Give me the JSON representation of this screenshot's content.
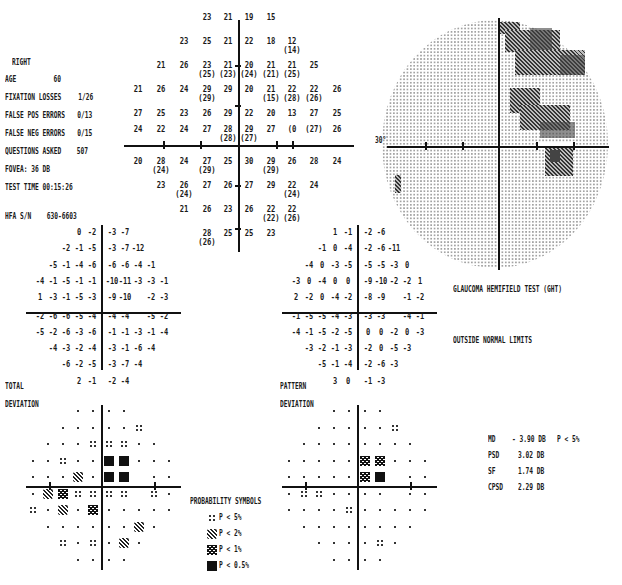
{
  "header": {
    "eye": "RIGHT",
    "age_label": "AGE",
    "age_value": "60",
    "fixation_losses_label": "FIXATION LOSSES",
    "fixation_losses_value": "1/26",
    "false_pos_label": "FALSE POS ERRORS",
    "false_pos_value": "0/13",
    "false_neg_label": "FALSE NEG ERRORS",
    "false_neg_value": "0/15",
    "questions_label": "QUESTIONS ASKED",
    "questions_value": "507",
    "fovea_label": "FOVEA:",
    "fovea_value": "36 DB",
    "test_time_label": "TEST TIME",
    "test_time_value": "00:15:26",
    "hfa_sn_label": "HFA S/N",
    "hfa_sn_value": "630-6603"
  },
  "threshold_grid": {
    "rows": [
      {
        "y": 13,
        "cells": [
          {
            "x": 207,
            "v": "23"
          },
          {
            "x": 228,
            "v": "21"
          },
          {
            "x": 249,
            "v": "19"
          },
          {
            "x": 271,
            "v": "15"
          }
        ]
      },
      {
        "y": 37,
        "cells": [
          {
            "x": 184,
            "v": "23"
          },
          {
            "x": 207,
            "v": "25"
          },
          {
            "x": 228,
            "v": "21"
          },
          {
            "x": 249,
            "v": "22"
          },
          {
            "x": 271,
            "v": "18"
          },
          {
            "x": 292,
            "v": "12",
            "p": "(14)"
          }
        ]
      },
      {
        "y": 61,
        "cells": [
          {
            "x": 161,
            "v": "21"
          },
          {
            "x": 184,
            "v": "26"
          },
          {
            "x": 207,
            "v": "23",
            "p": "(25)"
          },
          {
            "x": 228,
            "v": "21",
            "p": "(23)"
          },
          {
            "x": 249,
            "v": "20",
            "p": "(24)"
          },
          {
            "x": 271,
            "v": "21",
            "p": "(21)"
          },
          {
            "x": 292,
            "v": "21",
            "p": "(25)"
          },
          {
            "x": 314,
            "v": "25"
          }
        ]
      },
      {
        "y": 85,
        "cells": [
          {
            "x": 138,
            "v": "21"
          },
          {
            "x": 161,
            "v": "26"
          },
          {
            "x": 184,
            "v": "24"
          },
          {
            "x": 207,
            "v": "29",
            "p": "(29)"
          },
          {
            "x": 228,
            "v": "29"
          },
          {
            "x": 249,
            "v": "20"
          },
          {
            "x": 271,
            "v": "21",
            "p": "(15)"
          },
          {
            "x": 292,
            "v": "22",
            "p": "(28)"
          },
          {
            "x": 314,
            "v": "22",
            "p": "(26)"
          },
          {
            "x": 337,
            "v": "26"
          }
        ]
      },
      {
        "y": 109,
        "cells": [
          {
            "x": 138,
            "v": "27"
          },
          {
            "x": 161,
            "v": "25"
          },
          {
            "x": 184,
            "v": "23"
          },
          {
            "x": 207,
            "v": "26"
          },
          {
            "x": 228,
            "v": "29"
          },
          {
            "x": 249,
            "v": "22"
          },
          {
            "x": 271,
            "v": "20"
          },
          {
            "x": 292,
            "v": "13"
          },
          {
            "x": 314,
            "v": "27"
          },
          {
            "x": 337,
            "v": "25"
          }
        ]
      },
      {
        "y": 125,
        "cells": [
          {
            "x": 138,
            "v": "24"
          },
          {
            "x": 161,
            "v": "22"
          },
          {
            "x": 184,
            "v": "24"
          },
          {
            "x": 207,
            "v": "27"
          },
          {
            "x": 228,
            "v": "28",
            "p": "(28)"
          },
          {
            "x": 249,
            "v": "29",
            "p": "(27)"
          },
          {
            "x": 271,
            "v": "27"
          },
          {
            "x": 292,
            "v": "(0"
          },
          {
            "x": 314,
            "v": "(27)"
          },
          {
            "x": 337,
            "v": "26"
          }
        ]
      },
      {
        "y": 157,
        "cells": [
          {
            "x": 138,
            "v": "20"
          },
          {
            "x": 161,
            "v": "28",
            "p": "(24)"
          },
          {
            "x": 184,
            "v": "24"
          },
          {
            "x": 207,
            "v": "27",
            "p": "(29)"
          },
          {
            "x": 228,
            "v": "25"
          },
          {
            "x": 249,
            "v": "30"
          },
          {
            "x": 271,
            "v": "29",
            "p": "(29)"
          },
          {
            "x": 292,
            "v": "26"
          },
          {
            "x": 314,
            "v": "28"
          },
          {
            "x": 337,
            "v": "24"
          }
        ]
      },
      {
        "y": 181,
        "cells": [
          {
            "x": 161,
            "v": "23"
          },
          {
            "x": 184,
            "v": "26",
            "p": "(24)"
          },
          {
            "x": 207,
            "v": "27"
          },
          {
            "x": 228,
            "v": "26"
          },
          {
            "x": 249,
            "v": "27"
          },
          {
            "x": 271,
            "v": "29"
          },
          {
            "x": 292,
            "v": "22",
            "p": "(24)"
          },
          {
            "x": 314,
            "v": "24"
          }
        ]
      },
      {
        "y": 205,
        "cells": [
          {
            "x": 184,
            "v": "21"
          },
          {
            "x": 207,
            "v": "26"
          },
          {
            "x": 228,
            "v": "23"
          },
          {
            "x": 249,
            "v": "26"
          },
          {
            "x": 271,
            "v": "22",
            "p": "(22)"
          },
          {
            "x": 292,
            "v": "22",
            "p": "(26)"
          }
        ]
      },
      {
        "y": 229,
        "cells": [
          {
            "x": 207,
            "v": "28",
            "p": "(26)"
          },
          {
            "x": 228,
            "v": "25"
          },
          {
            "x": 249,
            "v": "25"
          },
          {
            "x": 271,
            "v": "23"
          }
        ]
      }
    ]
  },
  "grayscale": {
    "degree_label": "30°"
  },
  "total_deviation": {
    "label_line1": "TOTAL",
    "label_line2": "DEVIATION",
    "rows": [
      [
        "",
        "",
        "",
        "0",
        "-2",
        "-3",
        "-7",
        "",
        "",
        ""
      ],
      [
        "",
        "",
        "-2",
        "-1",
        "-5",
        "-3",
        "-7",
        "-12",
        "",
        ""
      ],
      [
        "",
        "-5",
        "-1",
        "-4",
        "-6",
        "-6",
        "-6",
        "-4",
        "-1",
        ""
      ],
      [
        "-4",
        "-1",
        "-5",
        "-1",
        "-1",
        "-10",
        "-11",
        "-3",
        "-3",
        "-1"
      ],
      [
        "1",
        "-3",
        "-1",
        "-5",
        "-3",
        "-9",
        "-10",
        "",
        "-2",
        "-3"
      ],
      [
        "-2",
        "-6",
        "-6",
        "-5",
        "-4",
        "-4",
        "-4",
        "",
        "-5",
        "-2"
      ],
      [
        "-5",
        "-2",
        "-6",
        "-3",
        "-6",
        "-1",
        "-1",
        "-3",
        "-1",
        "-4"
      ],
      [
        "",
        "-4",
        "-3",
        "-2",
        "-4",
        "-3",
        "-1",
        "-6",
        "-4",
        ""
      ],
      [
        "",
        "",
        "-6",
        "-2",
        "-5",
        "-3",
        "-7",
        "-4",
        "",
        ""
      ],
      [
        "",
        "",
        "",
        "2",
        "-1",
        "-2",
        "-4",
        "",
        "",
        ""
      ]
    ]
  },
  "pattern_deviation": {
    "label_line1": "PATTERN",
    "label_line2": "DEVIATION",
    "rows": [
      [
        "",
        "",
        "",
        "1",
        "-1",
        "-2",
        "-6",
        "",
        "",
        ""
      ],
      [
        "",
        "",
        "-1",
        "0",
        "-4",
        "-2",
        "-6",
        "-11",
        "",
        ""
      ],
      [
        "",
        "-4",
        "0",
        "-3",
        "-5",
        "-5",
        "-5",
        "-3",
        "0",
        ""
      ],
      [
        "-3",
        "0",
        "-4",
        "0",
        "0",
        "-9",
        "-10",
        "-2",
        "-2",
        "1"
      ],
      [
        "2",
        "-2",
        "0",
        "-4",
        "-2",
        "-8",
        "-9",
        "",
        "-1",
        "-2"
      ],
      [
        "-1",
        "-5",
        "-5",
        "-4",
        "-3",
        "-3",
        "-3",
        "",
        "-4",
        "-1"
      ],
      [
        "-4",
        "-1",
        "-5",
        "-2",
        "-5",
        "0",
        "0",
        "-2",
        "0",
        "-3"
      ],
      [
        "",
        "-3",
        "-2",
        "-1",
        "-3",
        "-2",
        "0",
        "-5",
        "-3",
        ""
      ],
      [
        "",
        "",
        "-5",
        "-1",
        "-4",
        "-2",
        "-6",
        "-3",
        "",
        ""
      ],
      [
        "",
        "",
        "",
        "3",
        "0",
        "-1",
        "-3",
        "",
        "",
        ""
      ]
    ]
  },
  "total_probability": {
    "rows": [
      [
        "",
        "",
        "",
        ".",
        ".",
        ".",
        ".",
        "",
        "",
        ""
      ],
      [
        "",
        "",
        ".",
        ".",
        ".",
        ".",
        ".",
        "p5",
        "",
        ""
      ],
      [
        "",
        ".",
        ".",
        ".",
        "p5",
        "p5",
        "p5",
        ".",
        ".",
        ""
      ],
      [
        ".",
        ".",
        "p5",
        ".",
        ".",
        "p05",
        "p05",
        ".",
        ".",
        "."
      ],
      [
        ".",
        ".",
        ".",
        "p2",
        ".",
        "p05",
        "p05",
        "",
        ".",
        "."
      ],
      [
        ".",
        "p2",
        "p1",
        "p5",
        "p5",
        "p5",
        "p5",
        "",
        "p5",
        "."
      ],
      [
        "p5",
        ".",
        "p2",
        ".",
        "p1",
        ".",
        ".",
        ".",
        ".",
        "."
      ],
      [
        "",
        ".",
        ".",
        ".",
        ".",
        ".",
        ".",
        "p2",
        ".",
        ""
      ],
      [
        "",
        "",
        "p5",
        ".",
        "p5",
        ".",
        "p2",
        ".",
        "",
        ""
      ],
      [
        "",
        "",
        "",
        ".",
        ".",
        ".",
        ".",
        "",
        "",
        ""
      ]
    ]
  },
  "pattern_probability": {
    "rows": [
      [
        "",
        "",
        "",
        ".",
        ".",
        ".",
        ".",
        "",
        "",
        ""
      ],
      [
        "",
        "",
        ".",
        ".",
        ".",
        ".",
        ".",
        "p5",
        "",
        ""
      ],
      [
        "",
        ".",
        ".",
        ".",
        ".",
        ".",
        ".",
        ".",
        ".",
        ""
      ],
      [
        ".",
        ".",
        ".",
        ".",
        ".",
        "p1",
        "p1",
        ".",
        ".",
        "."
      ],
      [
        ".",
        ".",
        ".",
        ".",
        ".",
        "p1",
        "p05",
        "",
        ".",
        "."
      ],
      [
        ".",
        "p5",
        "p5",
        ".",
        ".",
        ".",
        ".",
        "",
        ".",
        "."
      ],
      [
        ".",
        ".",
        ".",
        ".",
        "p5",
        ".",
        ".",
        ".",
        ".",
        "."
      ],
      [
        "",
        ".",
        ".",
        ".",
        ".",
        ".",
        ".",
        ".",
        ".",
        ""
      ],
      [
        "",
        "",
        ".",
        ".",
        ".",
        ".",
        "p5",
        ".",
        "",
        ""
      ],
      [
        "",
        "",
        "",
        ".",
        ".",
        ".",
        ".",
        "",
        "",
        ""
      ]
    ]
  },
  "legend": {
    "title": "PROBABILITY SYMBOLS",
    "items": [
      {
        "symbol": "p5",
        "label": "P <  5%"
      },
      {
        "symbol": "p2",
        "label": "P <  2%"
      },
      {
        "symbol": "p1",
        "label": "P <  1%"
      },
      {
        "symbol": "p05",
        "label": "P < 0.5%"
      }
    ]
  },
  "ght": {
    "title": "GLAUCOMA HEMIFIELD TEST (GHT)",
    "result": "OUTSIDE NORMAL LIMITS"
  },
  "indices": {
    "md_label": "MD",
    "md_value": "- 3.90 DB",
    "md_p": "P <   5%",
    "psd_label": "PSD",
    "psd_value": "3.02 DB",
    "sf_label": "SF",
    "sf_value": "1.74 DB",
    "cpsd_label": "CPSD",
    "cpsd_value": "2.29 DB"
  }
}
